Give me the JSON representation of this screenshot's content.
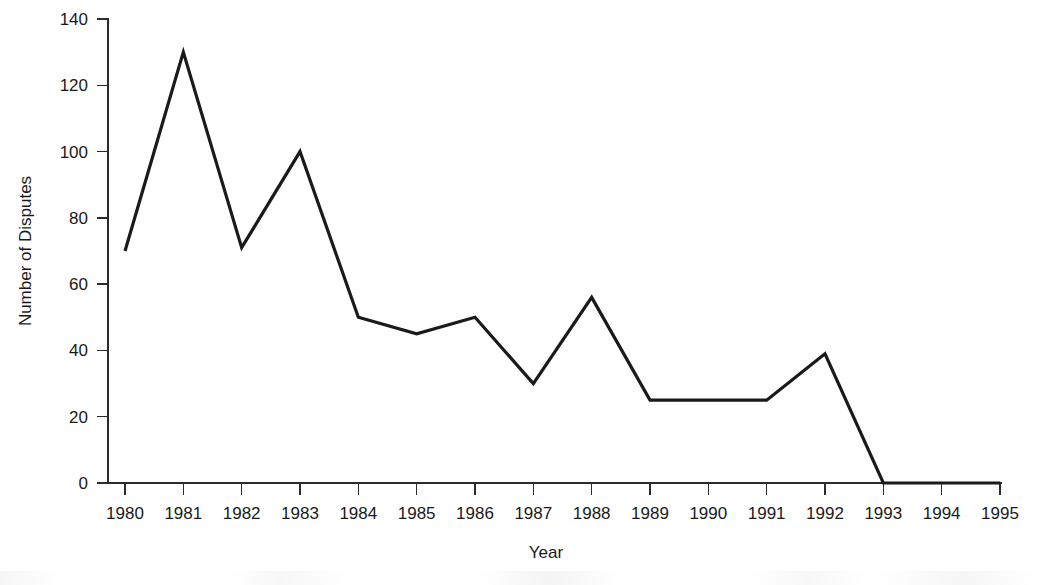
{
  "chart_data": {
    "type": "line",
    "title": "",
    "subtitle": "",
    "xlabel": "Year",
    "ylabel": "Number of Disputes",
    "categories": [
      "1980",
      "1981",
      "1982",
      "1983",
      "1984",
      "1985",
      "1986",
      "1987",
      "1988",
      "1989",
      "1990",
      "1991",
      "1992",
      "1993",
      "1994",
      "1995"
    ],
    "x": [
      1980,
      1981,
      1982,
      1983,
      1984,
      1985,
      1986,
      1987,
      1988,
      1989,
      1990,
      1991,
      1992,
      1993,
      1994,
      1995
    ],
    "values": [
      70,
      130,
      71,
      100,
      50,
      45,
      50,
      30,
      56,
      25,
      25,
      25,
      39,
      0,
      0,
      0
    ],
    "series": [
      {
        "name": "Number of Disputes",
        "values": [
          70,
          130,
          71,
          100,
          50,
          45,
          50,
          30,
          56,
          25,
          25,
          25,
          39,
          0,
          0,
          0
        ]
      }
    ],
    "xlim": [
      1980,
      1995
    ],
    "ylim": [
      0,
      140
    ],
    "yticks": [
      0,
      20,
      40,
      60,
      80,
      100,
      120,
      140
    ],
    "ytick_labels": [
      "0",
      "20",
      "40",
      "60",
      "80",
      "100",
      "120",
      "140"
    ],
    "xticks": [
      1980,
      1981,
      1982,
      1983,
      1984,
      1985,
      1986,
      1987,
      1988,
      1989,
      1990,
      1991,
      1992,
      1993,
      1994,
      1995
    ],
    "xtick_labels": [
      "1980",
      "1981",
      "1982",
      "1983",
      "1984",
      "1985",
      "1986",
      "1987",
      "1988",
      "1989",
      "1990",
      "1991",
      "1992",
      "1993",
      "1994",
      "1995"
    ],
    "grid": false,
    "legend": false,
    "legend_position": "none",
    "line_color": "#1a1a1a",
    "axis_color": "#2b2b2b",
    "background_color": "#ffffff",
    "annotations": []
  }
}
